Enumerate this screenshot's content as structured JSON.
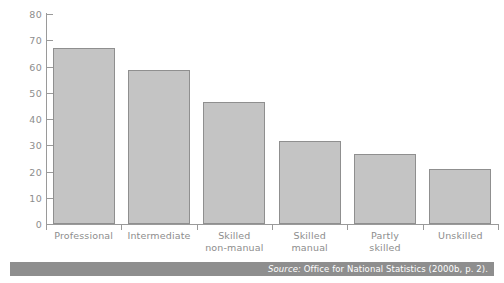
{
  "chart_data": {
    "type": "bar",
    "title": "",
    "subtitle": "",
    "xlabel": "",
    "ylabel": "",
    "categories": [
      "Professional",
      "Intermediate",
      "Skilled non-manual",
      "Skilled manual",
      "Partly skilled",
      "Unskilled"
    ],
    "category_lines": [
      [
        "Professional"
      ],
      [
        "Intermediate"
      ],
      [
        "Skilled",
        "non-manual"
      ],
      [
        "Skilled",
        "manual"
      ],
      [
        "Partly",
        "skilled"
      ],
      [
        "Unskilled"
      ]
    ],
    "values": [
      67,
      58.5,
      46.5,
      31.5,
      26.5,
      21
    ],
    "ylim": [
      0,
      80
    ],
    "ytick_values": [
      0,
      10,
      20,
      30,
      40,
      50,
      60,
      70,
      80
    ],
    "ytick_labels": [
      "0",
      "10",
      "20",
      "30",
      "40",
      "50",
      "60",
      "70",
      "80"
    ],
    "grid": false,
    "legend": null,
    "legend_position": "none",
    "bar_fill": "#c4c4c4",
    "bar_border": "#8f8f8f",
    "axis_color": "#9a9a9a",
    "tick_label_color": "#8d8d8d"
  },
  "source": {
    "prefix": "Source:",
    "text": "Office for National Statistics (2000b, p. 2).",
    "band_color": "#8e8e8e",
    "text_color": "#ffffff"
  }
}
